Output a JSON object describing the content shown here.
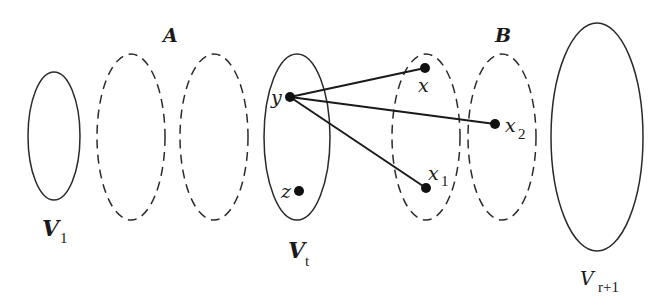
{
  "diagram": {
    "sets": [
      {
        "id": "V1",
        "style": "solid",
        "label": "V",
        "subscript": "1"
      },
      {
        "id": "A1",
        "style": "dashed",
        "group": "A"
      },
      {
        "id": "A2",
        "style": "dashed",
        "group": "A"
      },
      {
        "id": "Vt",
        "style": "solid",
        "label": "V",
        "subscript": "t"
      },
      {
        "id": "Xset",
        "style": "dashed"
      },
      {
        "id": "B1",
        "style": "dashed",
        "group": "B"
      },
      {
        "id": "Vr1",
        "style": "solid",
        "label": "V",
        "subscript": "r+1"
      }
    ],
    "group_labels": {
      "A": "A",
      "B": "B"
    },
    "vertices": [
      {
        "id": "y",
        "label": "y",
        "subscript": "",
        "in_set": "Vt"
      },
      {
        "id": "z",
        "label": "z",
        "subscript": "",
        "in_set": "Vt"
      },
      {
        "id": "x",
        "label": "x",
        "subscript": "",
        "in_set": "Xset"
      },
      {
        "id": "x1",
        "label": "x",
        "subscript": "1",
        "in_set": "Xset"
      },
      {
        "id": "x2",
        "label": "x",
        "subscript": "2",
        "in_set": "B1"
      }
    ],
    "edges": [
      {
        "from": "y",
        "to": "x"
      },
      {
        "from": "y",
        "to": "x2"
      },
      {
        "from": "y",
        "to": "x1"
      }
    ],
    "colors": {
      "stroke": "#2a2a2a",
      "point": "#111111",
      "background": "#ffffff"
    }
  }
}
